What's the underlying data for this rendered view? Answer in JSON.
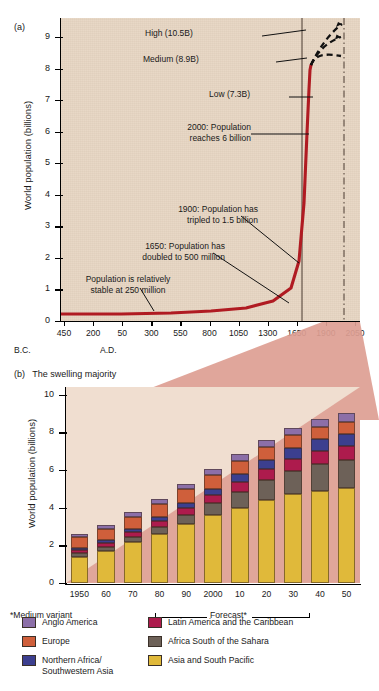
{
  "figure": {
    "panel_a_tag": "(a)",
    "panel_b_tag": "(b)",
    "panel_b_title": "The swelling majority",
    "ylabel": "World population (billions)",
    "footnote": "*Medium variant",
    "forecast_label": "Forecast*",
    "era_bc": "B.C.",
    "era_ad": "A.D."
  },
  "colors": {
    "plot_a_bg": "#e6d4c1",
    "plot_b_bg": "#f0ded0",
    "wedge": "#dd9e92",
    "curve": "#b01b22",
    "anglo_america": "#8c6fa8",
    "europe": "#cf5f3b",
    "northern_africa_sw_asia": "#3c3f8f",
    "latin_america": "#ad1b4d",
    "africa_south_sahara": "#6d6158",
    "asia_south_pacific": "#e0b93a"
  },
  "chart_data": [
    {
      "type": "line",
      "id": "panel-a",
      "title": "",
      "xlabel": "",
      "ylabel": "World population (billions)",
      "ylim": [
        0,
        9.6
      ],
      "yticks": [
        0,
        1,
        2,
        3,
        4,
        5,
        6,
        7,
        8,
        9
      ],
      "xtick_labels": [
        "450",
        "200",
        "50",
        "300",
        "550",
        "800",
        "1050",
        "1300",
        "1650",
        "1900",
        "2050"
      ],
      "x_era_left": "B.C.",
      "x_era_right": "A.D.",
      "grid": false,
      "series": [
        {
          "name": "World population (historical)",
          "color": "#b01b22",
          "points": [
            {
              "x": -450,
              "y": 0.2
            },
            {
              "x": -200,
              "y": 0.2
            },
            {
              "x": -50,
              "y": 0.2
            },
            {
              "x": 300,
              "y": 0.2
            },
            {
              "x": 550,
              "y": 0.22
            },
            {
              "x": 800,
              "y": 0.24
            },
            {
              "x": 1050,
              "y": 0.28
            },
            {
              "x": 1300,
              "y": 0.36
            },
            {
              "x": 1650,
              "y": 0.5
            },
            {
              "x": 1800,
              "y": 0.9
            },
            {
              "x": 1900,
              "y": 1.5
            },
            {
              "x": 1950,
              "y": 2.5
            },
            {
              "x": 2000,
              "y": 6.0
            }
          ]
        },
        {
          "name": "High projection",
          "color": "#000000",
          "style": "dashed",
          "points": [
            {
              "x": 2000,
              "y": 6.0
            },
            {
              "x": 2050,
              "y": 10.5
            }
          ]
        },
        {
          "name": "Medium projection",
          "color": "#000000",
          "style": "dashed",
          "points": [
            {
              "x": 2000,
              "y": 6.0
            },
            {
              "x": 2050,
              "y": 8.9
            }
          ]
        },
        {
          "name": "Low projection",
          "color": "#000000",
          "style": "dashed",
          "points": [
            {
              "x": 2000,
              "y": 6.0
            },
            {
              "x": 2050,
              "y": 7.3
            }
          ]
        }
      ],
      "annotations": [
        {
          "id": "high",
          "text": "High (10.5B)",
          "value": 10.5
        },
        {
          "id": "medium",
          "text": "Medium (8.9B)",
          "value": 8.9
        },
        {
          "id": "low",
          "text": "Low (7.3B)",
          "value": 7.3
        },
        {
          "id": "y2000",
          "line1": "2000: Population",
          "line2": "reaches 6 billion",
          "value": 6.0
        },
        {
          "id": "y1900",
          "line1": "1900: Population has",
          "line2": "tripled to 1.5 billion",
          "value": 1.5
        },
        {
          "id": "y1650",
          "line1": "1650: Population has",
          "line2": "doubled to 500 million",
          "value": 0.5
        },
        {
          "id": "stable",
          "line1": "Population is relatively",
          "line2": "stable at 250 million",
          "value": 0.25
        }
      ]
    },
    {
      "type": "bar",
      "id": "panel-b",
      "stacked": true,
      "title": "The swelling majority",
      "xlabel": "",
      "ylabel": "World population (billions)",
      "ylim": [
        0,
        10.4
      ],
      "yticks": [
        0,
        2,
        4,
        6,
        8,
        10
      ],
      "categories": [
        "1950",
        "60",
        "70",
        "80",
        "90",
        "2000",
        "10",
        "20",
        "30",
        "40",
        "50"
      ],
      "forecast_from": "2000",
      "legend_position": "below",
      "series": [
        {
          "name": "Asia and South Pacific",
          "color": "#e0b93a",
          "values": [
            1.4,
            1.7,
            2.15,
            2.6,
            3.15,
            3.6,
            4.0,
            4.4,
            4.7,
            4.88,
            5.05
          ]
        },
        {
          "name": "Africa South of the Sahara",
          "color": "#6d6158",
          "values": [
            0.18,
            0.22,
            0.28,
            0.36,
            0.46,
            0.62,
            0.82,
            1.05,
            1.25,
            1.45,
            1.5
          ]
        },
        {
          "name": "Latin America and the Caribbean",
          "color": "#ad1b4d",
          "values": [
            0.17,
            0.21,
            0.26,
            0.32,
            0.38,
            0.44,
            0.52,
            0.58,
            0.64,
            0.68,
            0.7
          ]
        },
        {
          "name": "Northern Africa/Southwestern Asia",
          "color": "#3c3f8f",
          "values": [
            0.1,
            0.13,
            0.17,
            0.22,
            0.28,
            0.34,
            0.42,
            0.5,
            0.56,
            0.62,
            0.66
          ]
        },
        {
          "name": "Europe",
          "color": "#cf5f3b",
          "values": [
            0.57,
            0.62,
            0.66,
            0.7,
            0.72,
            0.73,
            0.72,
            0.7,
            0.68,
            0.66,
            0.64
          ]
        },
        {
          "name": "Anglo America",
          "color": "#8c6fa8",
          "values": [
            0.17,
            0.2,
            0.23,
            0.26,
            0.29,
            0.32,
            0.35,
            0.38,
            0.4,
            0.43,
            0.45
          ]
        }
      ],
      "totals": [
        2.59,
        3.08,
        3.75,
        4.46,
        5.28,
        6.05,
        6.83,
        7.61,
        8.23,
        8.72,
        9.0
      ]
    }
  ],
  "legend": {
    "items": [
      {
        "label": "Anglo America",
        "color": "#8c6fa8",
        "col": 0,
        "row": 0
      },
      {
        "label": "Europe",
        "color": "#cf5f3b",
        "col": 0,
        "row": 1
      },
      {
        "label": "Northern Africa/",
        "label2": "Southwestern Asia",
        "color": "#3c3f8f",
        "col": 0,
        "row": 2
      },
      {
        "label": "Latin America and the Caribbean",
        "color": "#ad1b4d",
        "col": 1,
        "row": 0
      },
      {
        "label": "Africa South of the Sahara",
        "color": "#6d6158",
        "col": 1,
        "row": 1
      },
      {
        "label": "Asia and South Pacific",
        "color": "#e0b93a",
        "col": 1,
        "row": 2
      }
    ]
  }
}
